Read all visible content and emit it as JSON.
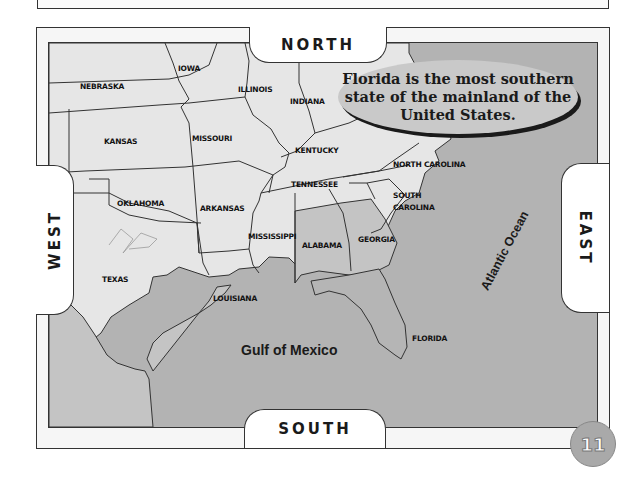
{
  "map": {
    "directions": {
      "north": "NORTH",
      "south": "SOUTH",
      "west": "WEST",
      "east": "EAST"
    },
    "callout": "Florida is the most southern state of the mainland of the United States.",
    "states": [
      {
        "name": "NEBRASKA",
        "highlight": false
      },
      {
        "name": "IOWA",
        "highlight": false
      },
      {
        "name": "ILLINOIS",
        "highlight": false
      },
      {
        "name": "INDIANA",
        "highlight": false
      },
      {
        "name": "KANSAS",
        "highlight": false
      },
      {
        "name": "MISSOURI",
        "highlight": false
      },
      {
        "name": "KENTUCKY",
        "highlight": false
      },
      {
        "name": "TENNESSEE",
        "highlight": false
      },
      {
        "name": "NORTH CAROLINA",
        "highlight": false
      },
      {
        "name": "OKLAHOMA",
        "highlight": false
      },
      {
        "name": "ARKANSAS",
        "highlight": false
      },
      {
        "name": "SOUTH CAROLINA",
        "highlight": false
      },
      {
        "name": "MISSISSIPPI",
        "highlight": false
      },
      {
        "name": "ALABAMA",
        "highlight": true
      },
      {
        "name": "GEORGIA",
        "highlight": true
      },
      {
        "name": "TEXAS",
        "highlight": false
      },
      {
        "name": "LOUISIANA",
        "highlight": false
      },
      {
        "name": "FLORIDA",
        "highlight": true
      }
    ],
    "water_bodies": {
      "gulf": "Gulf of Mexico",
      "ocean": "Atlantic Ocean"
    },
    "colors": {
      "land": "#e6e6e6",
      "highlight_states": "#c4c4c4",
      "florida": "#b5b5b5",
      "water": "#b3b3b3",
      "border": "#333333"
    }
  },
  "page_number": "11"
}
